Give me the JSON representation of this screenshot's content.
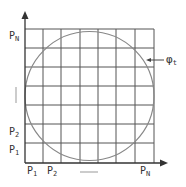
{
  "diagram": {
    "type": "grid-with-inscribed-circle",
    "grid": {
      "columns": 7,
      "rows": 7,
      "line_color": "#555555"
    },
    "circle": {
      "color": "#888888",
      "label": "φ",
      "label_sub": "t"
    },
    "axes": {
      "y_labels": [
        {
          "main": "P",
          "sub": "N"
        },
        {
          "main": "P",
          "sub": "2"
        },
        {
          "main": "P",
          "sub": "1"
        }
      ],
      "x_labels": [
        {
          "main": "P",
          "sub": "1"
        },
        {
          "main": "P",
          "sub": "2"
        },
        {
          "main": "P",
          "sub": "N"
        }
      ],
      "y_axis_symbol": "|",
      "x_axis_symbol": "—"
    }
  }
}
